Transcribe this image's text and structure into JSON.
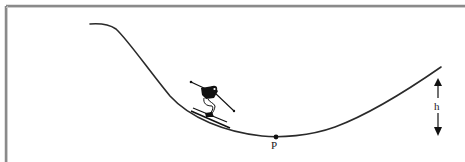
{
  "diagram": {
    "labels": {
      "point": "P",
      "height": "h"
    },
    "colors": {
      "border": "#8a8a8a",
      "stroke": "#2a2a2a",
      "background": "#ffffff"
    },
    "elements": [
      {
        "type": "track",
        "shape": "valley curve",
        "start": [
          90,
          24
        ],
        "lowest": [
          274,
          138
        ],
        "end": [
          441,
          67
        ]
      },
      {
        "type": "skier",
        "position": [
          205,
          105
        ]
      },
      {
        "type": "point",
        "label": "P",
        "position": [
          274,
          137
        ]
      },
      {
        "type": "height-arrow",
        "label": "h",
        "x": 438,
        "top": 80,
        "bottom": 136
      }
    ]
  }
}
